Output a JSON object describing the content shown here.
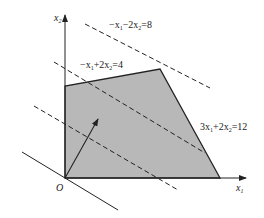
{
  "figure": {
    "axes": {
      "x_label": "x",
      "x_sub": "1",
      "y_label": "x",
      "y_sub": "2",
      "origin_label": "O"
    },
    "constraints": [
      {
        "label_a": "−x",
        "sub_a": "1",
        "label_b": "−2x",
        "sub_b": "2",
        "label_c": "=8",
        "style": "dashed"
      },
      {
        "label_a": "−x",
        "sub_a": "1",
        "label_b": "+2x",
        "sub_b": "2",
        "label_c": "=4",
        "style": "solid-edge"
      },
      {
        "label_a": "3x",
        "sub_a": "1",
        "label_b": "+2x",
        "sub_b": "2",
        "label_c": "=12",
        "style": "solid-edge"
      }
    ],
    "feasible_region": {
      "vertices_px": [
        [
          65,
          178
        ],
        [
          65,
          86
        ],
        [
          160,
          69
        ],
        [
          220,
          178
        ]
      ],
      "fill": "#b8b8b8",
      "stroke": "#222222"
    },
    "gradient_arrow": {
      "from_px": [
        65,
        178
      ],
      "to_px": [
        98,
        119
      ]
    },
    "colors": {
      "line": "#222222",
      "fill": "#b8b8b8",
      "background": "#ffffff"
    }
  }
}
